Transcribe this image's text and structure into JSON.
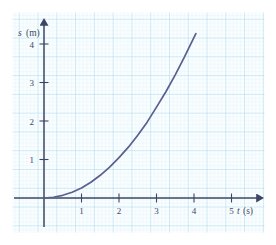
{
  "figure": {
    "background_color": "#ffffff",
    "paper_color": "#fbfeff",
    "grid_minor_color": "#d8eef6",
    "grid_major_color": "#aed8ec",
    "axis_color": "#3b4663",
    "curve_color": "#58608f"
  },
  "axes": {
    "y": {
      "symbol": "s",
      "unit": "(m)",
      "label": "s (m)"
    },
    "x": {
      "symbol": "t",
      "unit": "(s)",
      "label": "t (s)"
    }
  },
  "ticks": {
    "y_labels": [
      "1",
      "2",
      "3",
      "4"
    ],
    "x_labels": [
      "1",
      "2",
      "3",
      "4",
      "5"
    ]
  },
  "chart_data": {
    "type": "line",
    "title": "",
    "xlabel": "t (s)",
    "ylabel": "s (m)",
    "xlim": [
      0,
      5.6
    ],
    "ylim": [
      0,
      4.6
    ],
    "grid": true,
    "legend": "none",
    "series": [
      {
        "name": "displacement",
        "color": "#58608f",
        "relation": "s = 0.26 t^2",
        "x": [
          0.0,
          0.25,
          0.5,
          0.75,
          1.0,
          1.25,
          1.5,
          1.75,
          2.0,
          2.25,
          2.5,
          2.75,
          3.0,
          3.25,
          3.5,
          3.75,
          4.0,
          4.05
        ],
        "y": [
          0.0,
          0.02,
          0.07,
          0.15,
          0.26,
          0.41,
          0.59,
          0.8,
          1.05,
          1.32,
          1.63,
          1.97,
          2.36,
          2.76,
          3.2,
          3.67,
          4.17,
          4.27
        ]
      }
    ],
    "annotations": []
  }
}
